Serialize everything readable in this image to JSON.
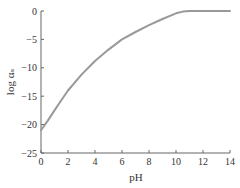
{
  "chart_data": {
    "type": "line",
    "title": "",
    "xlabel": "pH",
    "ylabel": "log αₛ",
    "xlim": [
      0,
      14
    ],
    "ylim": [
      -25,
      0
    ],
    "grid": false,
    "legend": null,
    "x_ticks": [
      "0",
      "2",
      "4",
      "6",
      "8",
      "10",
      "12",
      "14"
    ],
    "y_ticks": [
      "0",
      "−5",
      "−10",
      "−15",
      "−20",
      "−25"
    ],
    "series": [
      {
        "name": "log αs",
        "color": "#999999",
        "x": [
          0,
          0.5,
          1,
          1.5,
          2,
          3,
          4,
          5,
          6,
          7,
          8,
          9,
          10,
          10.5,
          11,
          12,
          13,
          14
        ],
        "y": [
          -21,
          -19.3,
          -17.5,
          -15.7,
          -14,
          -11.2,
          -8.8,
          -6.8,
          -5,
          -3.7,
          -2.5,
          -1.4,
          -0.4,
          -0.1,
          0,
          0,
          0,
          0
        ]
      }
    ]
  }
}
